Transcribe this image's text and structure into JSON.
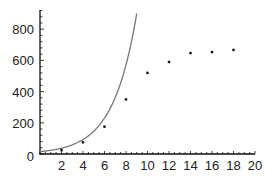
{
  "chart_data": {
    "type": "scatter",
    "title": "",
    "xlabel": "",
    "ylabel": "",
    "xlim": [
      0,
      20
    ],
    "ylim": [
      0,
      900
    ],
    "grid": false,
    "legend": null,
    "x_ticks": [
      2,
      4,
      6,
      8,
      10,
      12,
      14,
      16,
      18,
      20
    ],
    "y_ticks": [
      0,
      200,
      400,
      600,
      800
    ],
    "series": [
      {
        "name": "data points",
        "type": "scatter",
        "x": [
          2,
          4,
          6,
          8,
          10,
          12,
          14,
          16,
          18
        ],
        "y": [
          25,
          75,
          175,
          350,
          520,
          590,
          647,
          653,
          667
        ]
      },
      {
        "name": "exponential model",
        "type": "line",
        "formula": "15*exp(0.455*x)",
        "a": 15,
        "k": 0.455,
        "x_range": [
          0,
          9
        ]
      }
    ]
  },
  "colors": {
    "axis": "#111111",
    "curve": "#777777",
    "points": "#111111"
  }
}
